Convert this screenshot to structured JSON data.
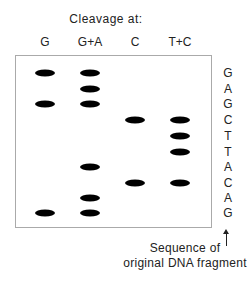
{
  "title": "Cleavage at:",
  "lanes": [
    {
      "label": "G",
      "x": 45
    },
    {
      "label": "G+A",
      "x": 90
    },
    {
      "label": "C",
      "x": 135
    },
    {
      "label": "T+C",
      "x": 180
    }
  ],
  "sequence": [
    "G",
    "A",
    "G",
    "C",
    "T",
    "T",
    "A",
    "C",
    "A",
    "G"
  ],
  "sequence_rows_y": [
    73,
    89,
    104,
    120,
    136,
    152,
    167,
    183,
    198,
    213
  ],
  "bands": [
    {
      "lane": "G",
      "row": 0
    },
    {
      "lane": "G",
      "row": 2
    },
    {
      "lane": "G",
      "row": 9
    },
    {
      "lane": "G+A",
      "row": 0
    },
    {
      "lane": "G+A",
      "row": 1
    },
    {
      "lane": "G+A",
      "row": 2
    },
    {
      "lane": "G+A",
      "row": 6
    },
    {
      "lane": "G+A",
      "row": 8
    },
    {
      "lane": "G+A",
      "row": 9
    },
    {
      "lane": "C",
      "row": 3
    },
    {
      "lane": "C",
      "row": 7
    },
    {
      "lane": "T+C",
      "row": 3
    },
    {
      "lane": "T+C",
      "row": 4
    },
    {
      "lane": "T+C",
      "row": 5
    },
    {
      "lane": "T+C",
      "row": 7
    }
  ],
  "caption": {
    "line1": "Sequence of",
    "line2": "original DNA fragment"
  }
}
